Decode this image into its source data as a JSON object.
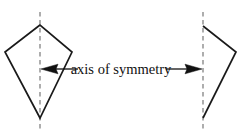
{
  "figure": {
    "kind": "geometry-diagram",
    "background_color": "#ffffff",
    "label": {
      "text": "axis of symmetry",
      "color": "#111111",
      "x": 121,
      "y": 69
    },
    "axes": [
      {
        "name": "left-axis-of-symmetry",
        "style": "dashed",
        "color": "#9a9a9a",
        "x": 40,
        "y_top": 12,
        "y_bottom": 129
      },
      {
        "name": "right-axis-of-symmetry",
        "style": "dashed",
        "color": "#9a9a9a",
        "x": 203,
        "y_top": 12,
        "y_bottom": 129
      }
    ],
    "shapes": [
      {
        "name": "left-kite",
        "stroke_color": "#1a1a1a",
        "fill": "none",
        "points": "40,25 5,52 40,118 72,52"
      },
      {
        "name": "right-half-kite",
        "stroke_color": "#1a1a1a",
        "fill": "none",
        "points": "203,26 236,52 203,118"
      }
    ],
    "arrows": [
      {
        "name": "left-arrow",
        "direction": "left",
        "color": "#111111",
        "tail_x": 78,
        "head_x": 41,
        "y": 69
      },
      {
        "name": "right-arrow",
        "direction": "right",
        "color": "#111111",
        "tail_x": 166,
        "head_x": 202,
        "y": 69
      }
    ]
  }
}
